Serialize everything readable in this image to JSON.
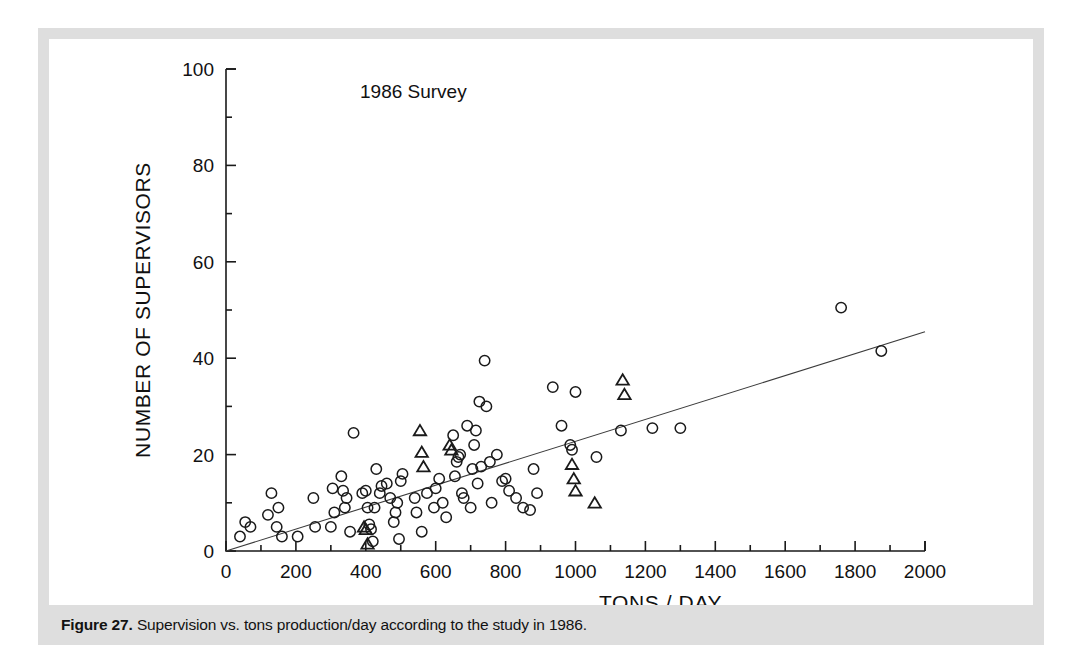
{
  "caption": {
    "label": "Figure 27.",
    "text": " Supervision vs. tons production/day according to the study in 1986."
  },
  "colors": {
    "frame": "#dedede",
    "panel": "#ffffff",
    "ink": "#1a1a1a",
    "fitline": "#3b3b3b"
  },
  "chart_data": {
    "type": "scatter",
    "title": "",
    "annotation": "1986 Survey",
    "xlabel": "TONS / DAY",
    "ylabel": "NUMBER OF SUPERVISORS",
    "xlim": [
      0,
      2000
    ],
    "ylim": [
      0,
      100
    ],
    "xticks": [
      0,
      200,
      400,
      600,
      800,
      1000,
      1200,
      1400,
      1600,
      1800,
      2000
    ],
    "xticklabels": [
      "0",
      "200",
      "400",
      "600",
      "800",
      "1000",
      "1200",
      "1400",
      "1600",
      "1800",
      "2000"
    ],
    "xminor": [
      100,
      300,
      500,
      700,
      900,
      1100,
      1300,
      1500,
      1700,
      1900
    ],
    "yticks": [
      0,
      20,
      40,
      60,
      80,
      100
    ],
    "yticklabels": [
      "0",
      "20",
      "40",
      "60",
      "80",
      "100"
    ],
    "yminor": [
      10,
      30,
      50,
      70,
      90
    ],
    "grid": false,
    "legend_position": "none",
    "trendline": {
      "label": "regression line",
      "x0": 0,
      "y0": 0,
      "x1": 2000,
      "y1": 45.5
    },
    "series": [
      {
        "name": "plants (circle marker)",
        "marker": "circle",
        "points": [
          [
            40,
            3
          ],
          [
            55,
            6
          ],
          [
            70,
            5
          ],
          [
            120,
            7.5
          ],
          [
            130,
            12
          ],
          [
            145,
            5
          ],
          [
            150,
            9
          ],
          [
            160,
            3
          ],
          [
            205,
            3
          ],
          [
            250,
            11
          ],
          [
            255,
            5
          ],
          [
            300,
            5
          ],
          [
            305,
            13
          ],
          [
            310,
            8
          ],
          [
            330,
            15.5
          ],
          [
            335,
            12.5
          ],
          [
            340,
            9
          ],
          [
            345,
            11
          ],
          [
            355,
            4
          ],
          [
            365,
            24.5
          ],
          [
            390,
            12
          ],
          [
            400,
            12.5
          ],
          [
            405,
            9
          ],
          [
            410,
            5.5
          ],
          [
            415,
            4.5
          ],
          [
            420,
            2
          ],
          [
            425,
            9
          ],
          [
            430,
            17
          ],
          [
            440,
            12
          ],
          [
            445,
            13.5
          ],
          [
            460,
            14
          ],
          [
            470,
            11
          ],
          [
            480,
            6
          ],
          [
            485,
            8
          ],
          [
            490,
            10
          ],
          [
            495,
            2.5
          ],
          [
            500,
            14.5
          ],
          [
            505,
            16
          ],
          [
            540,
            11
          ],
          [
            545,
            8
          ],
          [
            560,
            4
          ],
          [
            575,
            12
          ],
          [
            595,
            9
          ],
          [
            600,
            13
          ],
          [
            610,
            15
          ],
          [
            620,
            10
          ],
          [
            630,
            7
          ],
          [
            650,
            24
          ],
          [
            655,
            15.5
          ],
          [
            660,
            18.5
          ],
          [
            665,
            19.5
          ],
          [
            670,
            20
          ],
          [
            675,
            12
          ],
          [
            680,
            11
          ],
          [
            690,
            26
          ],
          [
            700,
            9
          ],
          [
            705,
            17
          ],
          [
            710,
            22
          ],
          [
            715,
            25
          ],
          [
            720,
            14
          ],
          [
            725,
            31
          ],
          [
            730,
            17.5
          ],
          [
            740,
            39.5
          ],
          [
            745,
            30
          ],
          [
            755,
            18.5
          ],
          [
            760,
            10
          ],
          [
            775,
            20
          ],
          [
            790,
            14.5
          ],
          [
            800,
            15
          ],
          [
            810,
            12.5
          ],
          [
            830,
            11
          ],
          [
            850,
            9
          ],
          [
            870,
            8.5
          ],
          [
            880,
            17
          ],
          [
            890,
            12
          ],
          [
            935,
            34
          ],
          [
            960,
            26
          ],
          [
            985,
            22
          ],
          [
            990,
            21
          ],
          [
            1000,
            33
          ],
          [
            1060,
            19.5
          ],
          [
            1130,
            25
          ],
          [
            1220,
            25.5
          ],
          [
            1300,
            25.5
          ],
          [
            1760,
            50.5
          ],
          [
            1875,
            41.5
          ]
        ]
      },
      {
        "name": "plants (triangle marker)",
        "marker": "triangle",
        "points": [
          [
            395,
            5
          ],
          [
            400,
            4.5
          ],
          [
            405,
            1.5
          ],
          [
            555,
            25
          ],
          [
            560,
            20.5
          ],
          [
            565,
            17.5
          ],
          [
            640,
            22
          ],
          [
            645,
            21
          ],
          [
            990,
            18
          ],
          [
            995,
            15
          ],
          [
            1000,
            12.5
          ],
          [
            1055,
            10
          ],
          [
            1135,
            35.5
          ],
          [
            1140,
            32.5
          ]
        ]
      }
    ]
  }
}
